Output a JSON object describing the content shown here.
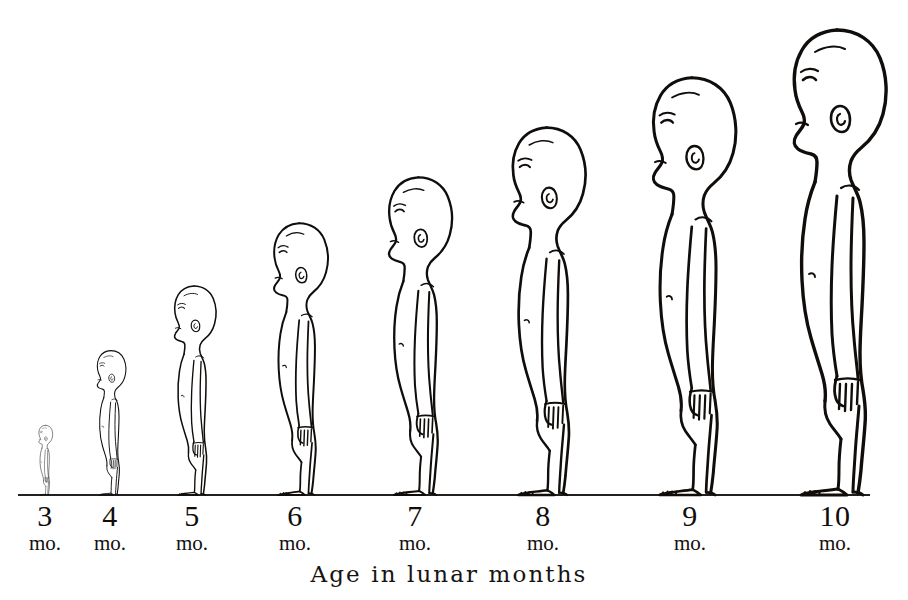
{
  "figure": {
    "background_color": "#ffffff",
    "ink_color": "#100d0b",
    "caption": "Age in lunar months",
    "watermark": "",
    "baseline": {
      "x_start": 18,
      "x_end": 870,
      "y": 495,
      "color": "#24201d"
    }
  },
  "chart_data": {
    "type": "bar",
    "title": "",
    "subtitle": "",
    "xlabel": "Age in lunar months",
    "ylabel": "",
    "categories": [
      "3",
      "4",
      "5",
      "6",
      "7",
      "8",
      "9",
      "10"
    ],
    "tick_labels": [
      "3",
      "4",
      "5",
      "6",
      "7",
      "8",
      "9",
      "10"
    ],
    "unit_labels": [
      "mo.",
      "mo.",
      "mo.",
      "mo.",
      "mo.",
      "mo.",
      "mo.",
      "mo."
    ],
    "values": [
      70,
      145,
      210,
      273,
      319,
      369,
      419,
      467
    ],
    "value_units": "pixels of drawn standing height above baseline",
    "legend": [],
    "grid": false,
    "annotations": [],
    "figures": [
      {
        "label": "3",
        "unit": "mo.",
        "center_x": 45,
        "tick_x": 45,
        "height_px": 70,
        "top_y": 425,
        "scale": 0.15
      },
      {
        "label": "4",
        "unit": "mo.",
        "center_x": 110,
        "tick_x": 110,
        "height_px": 145,
        "top_y": 350,
        "scale": 0.311
      },
      {
        "label": "5",
        "unit": "mo.",
        "center_x": 193,
        "tick_x": 192,
        "height_px": 210,
        "top_y": 285,
        "scale": 0.45
      },
      {
        "label": "6",
        "unit": "mo.",
        "center_x": 298,
        "tick_x": 295,
        "height_px": 273,
        "top_y": 222,
        "scale": 0.585
      },
      {
        "label": "7",
        "unit": "mo.",
        "center_x": 417,
        "tick_x": 415,
        "height_px": 319,
        "top_y": 176,
        "scale": 0.683
      },
      {
        "label": "8",
        "unit": "mo.",
        "center_x": 545,
        "tick_x": 543,
        "height_px": 369,
        "top_y": 126,
        "scale": 0.79
      },
      {
        "label": "9",
        "unit": "mo.",
        "center_x": 690,
        "tick_x": 690,
        "height_px": 419,
        "top_y": 76,
        "scale": 0.897
      },
      {
        "label": "10",
        "unit": "mo.",
        "center_x": 835,
        "tick_x": 835,
        "height_px": 467,
        "top_y": 28,
        "scale": 1.0
      }
    ]
  }
}
